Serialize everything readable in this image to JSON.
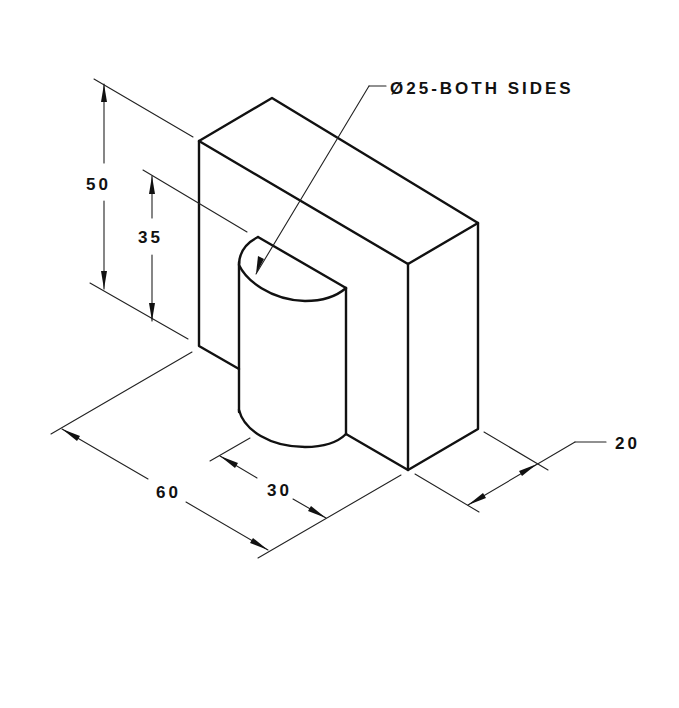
{
  "drawing": {
    "type": "isometric engineering drawing",
    "units": "mm",
    "dimensions": {
      "overall_height": "50",
      "inner_height": "35",
      "overall_length": "60",
      "boss_width": "30",
      "depth": "20",
      "hole_note": "Ø25-BOTH SIDES"
    },
    "colors": {
      "line": "#111111",
      "background": "#ffffff"
    }
  }
}
